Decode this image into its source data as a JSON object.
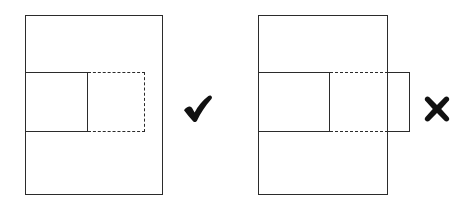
{
  "diagram": {
    "background_color": "#ffffff",
    "stroke_color": "#2b2b2b",
    "panels": [
      {
        "id": "correct",
        "verdict": "correct",
        "verdict_icon": "checkmark-icon",
        "verdict_symbol": "✔",
        "verdict_label": "Correct",
        "outer": {
          "name": "outer-container-rect",
          "style": "solid",
          "x": 25,
          "y": 15,
          "width": 138,
          "height": 180
        },
        "shapes": [
          {
            "name": "inner-solid-rect",
            "style": "solid",
            "x": 25,
            "y": 72,
            "width": 63,
            "height": 60
          },
          {
            "name": "inner-dashed-rect",
            "style": "dashed",
            "x": 88,
            "y": 72,
            "width": 57,
            "height": 60
          }
        ]
      },
      {
        "id": "incorrect",
        "verdict": "incorrect",
        "verdict_icon": "cross-icon",
        "verdict_symbol": "✖",
        "verdict_label": "Incorrect",
        "outer": {
          "name": "outer-container-rect",
          "style": "solid",
          "x": 26,
          "y": 15,
          "width": 130,
          "height": 180
        },
        "shapes": [
          {
            "name": "inner-solid-rect",
            "style": "solid",
            "x": 26,
            "y": 72,
            "width": 72,
            "height": 60
          },
          {
            "name": "inner-dashed-rect",
            "style": "dashed",
            "x": 98,
            "y": 72,
            "width": 58,
            "height": 60
          },
          {
            "name": "overflow-rect",
            "style": "solid",
            "x": 156,
            "y": 72,
            "width": 22,
            "height": 60
          }
        ]
      }
    ]
  }
}
